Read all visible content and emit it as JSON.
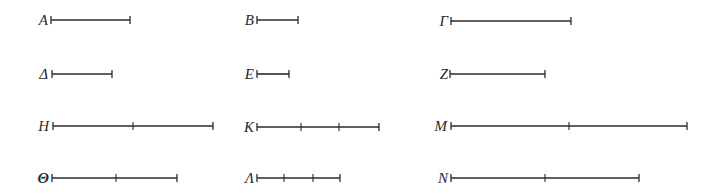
{
  "diagram": {
    "title": "",
    "stroke_color": "#2a2a2a",
    "tick_half_height": 4,
    "segments": [
      {
        "label": "A",
        "label_x": 28,
        "x1": 51,
        "x2": 130,
        "y": 20,
        "ticks": []
      },
      {
        "label": "B",
        "label_x": 234,
        "x1": 257,
        "x2": 298,
        "y": 20,
        "ticks": []
      },
      {
        "label": "Γ",
        "label_x": 428,
        "x1": 451,
        "x2": 571,
        "y": 21,
        "ticks": []
      },
      {
        "label": "Δ",
        "label_x": 28,
        "x1": 52,
        "x2": 112,
        "y": 74,
        "ticks": []
      },
      {
        "label": "E",
        "label_x": 234,
        "x1": 257,
        "x2": 289,
        "y": 74,
        "ticks": []
      },
      {
        "label": "Z",
        "label_x": 428,
        "x1": 450,
        "x2": 545,
        "y": 74,
        "ticks": []
      },
      {
        "label": "H",
        "label_x": 29,
        "x1": 53,
        "x2": 213,
        "y": 126,
        "ticks": [
          133
        ]
      },
      {
        "label": "K",
        "label_x": 234,
        "x1": 257,
        "x2": 379,
        "y": 127,
        "ticks": [
          301,
          339
        ]
      },
      {
        "label": "M",
        "label_x": 427,
        "x1": 451,
        "x2": 687,
        "y": 126,
        "ticks": [
          569
        ]
      },
      {
        "label": "Θ",
        "label_x": 29,
        "x1": 52,
        "x2": 177,
        "y": 178,
        "ticks": [
          116
        ],
        "bold": true
      },
      {
        "label": "Λ",
        "label_x": 234,
        "x1": 257,
        "x2": 340,
        "y": 178,
        "ticks": [
          284,
          313
        ]
      },
      {
        "label": "N",
        "label_x": 428,
        "x1": 451,
        "x2": 639,
        "y": 178,
        "ticks": [
          545
        ]
      }
    ]
  }
}
